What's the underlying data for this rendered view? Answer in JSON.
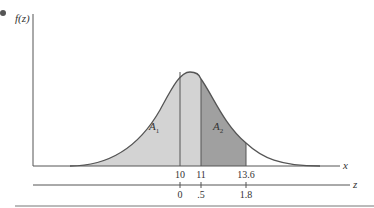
{
  "diagram": {
    "y_axis_label": "f(z)",
    "x_axis_label": "x",
    "z_axis_label": "z",
    "regions": [
      {
        "label_main": "A",
        "label_sub": "1",
        "fill": "#d3d3d3"
      },
      {
        "label_main": "A",
        "label_sub": "2",
        "fill": "#a0a0a0"
      }
    ],
    "x_ticks": [
      "10",
      "11",
      "13.6"
    ],
    "z_ticks": [
      "0",
      ".5",
      "1.8"
    ],
    "colors": {
      "axis": "#555555",
      "curve": "#555555",
      "light_fill": "#d3d3d3",
      "dark_fill": "#a0a0a0",
      "bullet": "#555555"
    }
  }
}
